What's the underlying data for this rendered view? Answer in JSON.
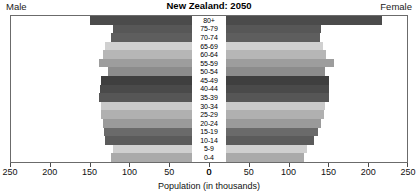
{
  "header": {
    "left_label": "Male",
    "right_label": "Female",
    "title": "New Zealand: 2050"
  },
  "axis": {
    "x_title": "Population (in thousands)",
    "left_ticks": [
      "250",
      "200",
      "150",
      "100",
      "50",
      "0"
    ],
    "right_ticks": [
      "0",
      "50",
      "100",
      "150",
      "200",
      "250"
    ]
  },
  "chart_data": {
    "type": "bar",
    "subtype": "population-pyramid",
    "title": "New Zealand: 2050",
    "xlabel": "Population (in thousands)",
    "ylabel": "",
    "xlim": [
      0,
      250
    ],
    "grid": false,
    "legend_position": "top",
    "categories": [
      "80+",
      "75-79",
      "70-74",
      "65-69",
      "60-64",
      "55-59",
      "50-54",
      "45-49",
      "40-44",
      "35-39",
      "30-34",
      "25-29",
      "20-24",
      "15-19",
      "10-14",
      "5-9",
      "0-4"
    ],
    "series": [
      {
        "name": "Male",
        "values": [
          150,
          121,
          124,
          131,
          134,
          139,
          128,
          136,
          138,
          139,
          136,
          136,
          134,
          132,
          131,
          121,
          124
        ]
      },
      {
        "name": "Female",
        "values": [
          219,
          142,
          140,
          144,
          148,
          158,
          146,
          151,
          152,
          151,
          146,
          145,
          142,
          137,
          133,
          124,
          120
        ]
      }
    ],
    "bar_shades": [
      "#4b4b4b",
      "#575757",
      "#5e5e5e",
      "#d0d0d0",
      "#b6b6b6",
      "#9d9d9d",
      "#8c8c8c",
      "#3f3f3f",
      "#4a4a4a",
      "#565656",
      "#c9c9c9",
      "#b0b0b0",
      "#9a9a9a",
      "#6a6a6a",
      "#5b5b5b",
      "#cfcfcf",
      "#aaaaaa"
    ]
  }
}
